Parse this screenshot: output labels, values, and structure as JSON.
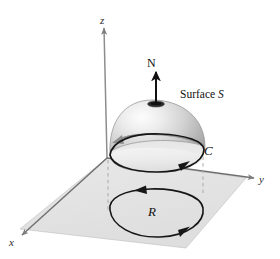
{
  "figure": {
    "background_color": "#ffffff",
    "labels": {
      "axis_z": "z",
      "axis_y": "y",
      "axis_x": "x",
      "normal_vector": "N",
      "surface_prefix": "Surface ",
      "surface_symbol": "S",
      "boundary_curve": "C",
      "plane_region": "R"
    },
    "colors": {
      "plane_fill": "#e3e3e3",
      "plane_edge": "#8a8a8a",
      "axis_line": "#8d8d8d",
      "curve_stroke": "#161616",
      "dome_light": "#fbfbfb",
      "dome_mid": "#c9c9c9",
      "dome_dark": "#8f8f8f",
      "dashed_line": "#a9a9a9",
      "arrow_on_surface": "#8e8e8e",
      "normal_arrow": "#111111"
    },
    "elements": {
      "plane": "shaded parallelogram representing the xy-plane",
      "dome": "shaded hemispherical surface S sitting above the plane",
      "rim_curve": "oriented boundary curve C around the base of the dome",
      "region_curve": "oriented closed curve bounding region R in the plane",
      "normal_arrow": "upward unit normal vector N at the apex of the dome",
      "surface_arrow": "gray orientation arrow drawn across the dome",
      "projection_lines": "two dashed vertical lines projecting C down to R"
    },
    "geometry": {
      "origin": [
        107,
        158
      ],
      "z_axis_tip": [
        104,
        26
      ],
      "y_axis_tip": [
        256,
        178
      ],
      "x_axis_tip": [
        20,
        236
      ],
      "dome_apex": [
        156,
        103
      ],
      "dome_base_left": [
        110,
        156
      ],
      "dome_base_right": [
        203,
        148
      ],
      "normal_arrow_from": [
        156,
        105
      ],
      "normal_arrow_to": [
        156,
        70
      ],
      "dashed_left_x": 107,
      "dashed_right_x": 203,
      "region_center": [
        155,
        212
      ]
    }
  }
}
